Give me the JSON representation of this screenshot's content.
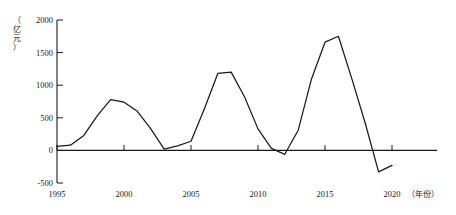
{
  "chart_data": {
    "type": "line",
    "title": "",
    "subtitle": "",
    "xlabel": "（年份）",
    "ylabel": "（亿元）",
    "ylabel_chars": [
      "（",
      "亿",
      "元",
      "）"
    ],
    "xlim": [
      1995,
      2021
    ],
    "ylim": [
      -500,
      2000
    ],
    "yticks": [
      2000,
      1500,
      1000,
      500,
      0,
      -500
    ],
    "ytick_labels": [
      "2000",
      "1500",
      "1000",
      "500",
      "0",
      "-500"
    ],
    "xticks": [
      1995,
      2000,
      2005,
      2010,
      2015,
      2020
    ],
    "xtick_labels": [
      "1995",
      "2000",
      "2005",
      "2010",
      "2015",
      "2020"
    ],
    "grid": false,
    "legend": null,
    "line_color": "#1a1a1a",
    "axis_color": "#1a1a1a",
    "background_color": "#ffffff",
    "x": [
      1995,
      1996,
      1997,
      1998,
      1999,
      2000,
      2001,
      2002,
      2003,
      2004,
      2005,
      2006,
      2007,
      2008,
      2009,
      2010,
      2011,
      2012,
      2013,
      2014,
      2015,
      2016,
      2017,
      2018,
      2019,
      2020
    ],
    "values": [
      60,
      80,
      230,
      530,
      780,
      740,
      600,
      330,
      20,
      70,
      140,
      640,
      1180,
      1200,
      820,
      330,
      30,
      -60,
      310,
      1100,
      1660,
      1750,
      1100,
      420,
      -330,
      -230
    ],
    "series": [
      {
        "name": "净额",
        "values": [
          60,
          80,
          230,
          530,
          780,
          740,
          600,
          330,
          20,
          70,
          140,
          640,
          1180,
          1200,
          820,
          330,
          30,
          -60,
          310,
          1100,
          1660,
          1750,
          1100,
          420,
          -330,
          -230
        ]
      }
    ],
    "annotations": [
      {
        "label": "第一个波峰",
        "x": 1999,
        "y": 780
      },
      {
        "label": "第二个波峰",
        "x": 2008,
        "y": 1200
      },
      {
        "label": "第三个波峰",
        "x": 2016,
        "y": 1750
      },
      {
        "label": "最低点",
        "x": 2019,
        "y": -330
      }
    ]
  }
}
